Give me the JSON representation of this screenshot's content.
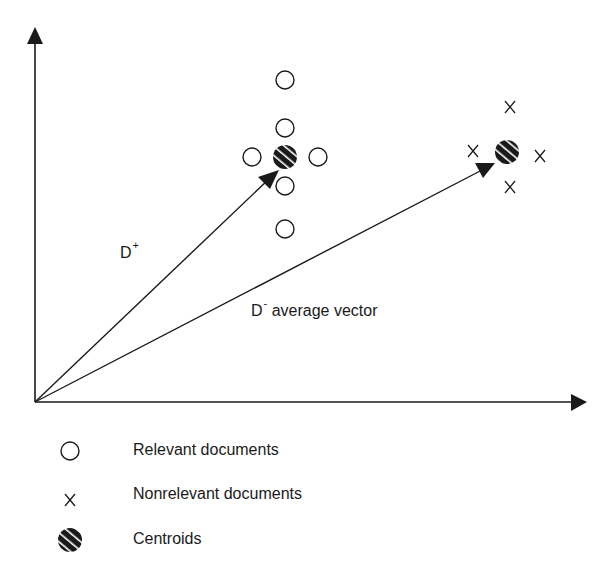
{
  "diagram": {
    "labels": {
      "d_plus_base": "D",
      "d_plus_sup": "+",
      "d_minus_base": "D",
      "d_minus_sup": "-",
      "d_minus_suffix": " average vector"
    },
    "markers": {
      "relevant": "O",
      "nonrelevant": "X"
    },
    "legend": [
      {
        "icon": "open-circle-icon",
        "label": "Relevant documents"
      },
      {
        "icon": "x-mark-icon",
        "label": "Nonrelevant documents"
      },
      {
        "icon": "hatched-circle-icon",
        "label": "Centroids"
      }
    ],
    "colors": {
      "ink": "#1a1a1a",
      "background": "#ffffff"
    }
  }
}
